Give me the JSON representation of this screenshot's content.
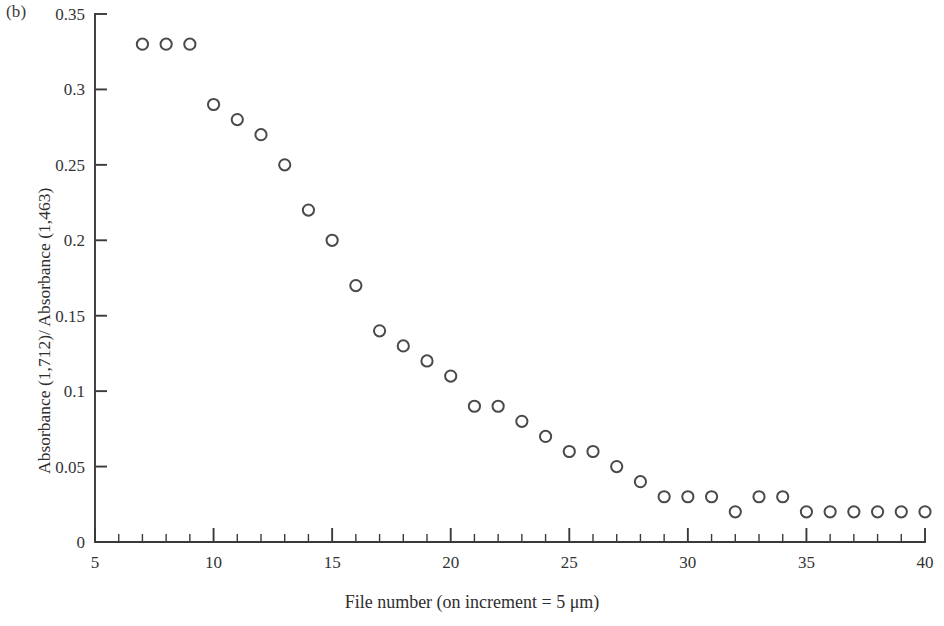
{
  "figure": {
    "panel_label": "(b)",
    "background_color": "#ffffff",
    "ink_color": "#3a3a3a",
    "marker_color": "#4a4a4a"
  },
  "chart_data": {
    "type": "scatter",
    "title": "",
    "panel": "(b)",
    "xlabel": "File number (on increment = 5 μm)",
    "ylabel": "Absorbance (1,712)/ Absorbance (1,463)",
    "xlim": [
      5,
      40
    ],
    "ylim": [
      0,
      0.35
    ],
    "grid": false,
    "legend": null,
    "marker_style": "open-circle",
    "x_major_ticks": [
      5,
      10,
      15,
      20,
      25,
      30,
      35,
      40
    ],
    "x_major_tick_labels": [
      "5",
      "10",
      "15",
      "20",
      "25",
      "30",
      "35",
      "40"
    ],
    "x_minor_tick_step": 1,
    "y_major_ticks": [
      0,
      0.05,
      0.1,
      0.15,
      0.2,
      0.25,
      0.3,
      0.35
    ],
    "y_major_tick_labels": [
      "0",
      "0.05",
      "0.1",
      "0.15",
      "0.2",
      "0.25",
      "0.3",
      "0.35"
    ],
    "x": [
      7,
      8,
      9,
      10,
      11,
      12,
      13,
      14,
      15,
      16,
      17,
      18,
      19,
      20,
      21,
      22,
      23,
      24,
      25,
      26,
      27,
      28,
      29,
      30,
      31,
      32,
      33,
      34,
      35,
      36,
      37,
      38,
      39,
      40
    ],
    "values": [
      0.33,
      0.33,
      0.33,
      0.29,
      0.28,
      0.27,
      0.25,
      0.22,
      0.2,
      0.17,
      0.14,
      0.13,
      0.12,
      0.11,
      0.09,
      0.09,
      0.08,
      0.07,
      0.06,
      0.06,
      0.05,
      0.04,
      0.03,
      0.03,
      0.03,
      0.02,
      0.03,
      0.03,
      0.02,
      0.02,
      0.02,
      0.02,
      0.02,
      0.02
    ],
    "n_points": 34
  }
}
